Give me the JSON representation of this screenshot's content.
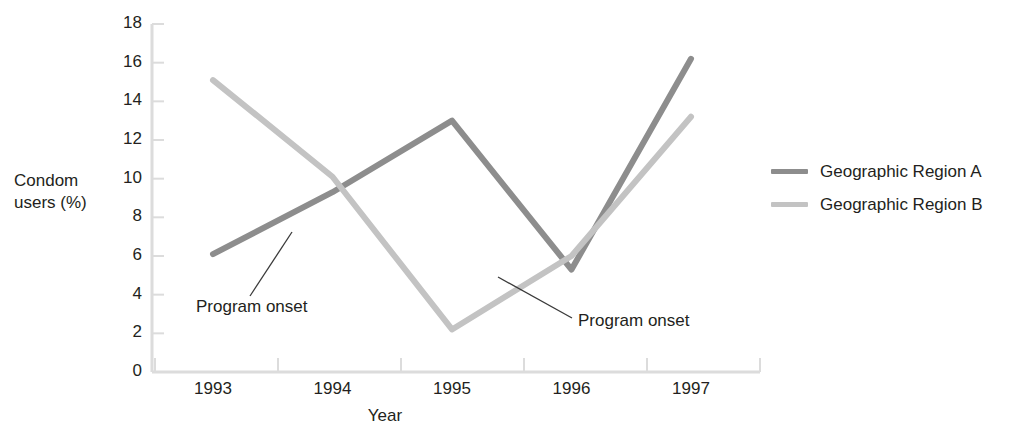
{
  "chart_data": {
    "type": "line",
    "title": "",
    "xlabel": "Year",
    "ylabel": "Condom users (%)",
    "categories": [
      "1993",
      "1994",
      "1995",
      "1996",
      "1997"
    ],
    "x": [
      1993,
      1994,
      1995,
      1996,
      1997
    ],
    "ylim": [
      0,
      18
    ],
    "yticks": [
      0,
      2,
      4,
      6,
      8,
      10,
      12,
      14,
      16,
      18
    ],
    "grid": false,
    "legend_position": "right",
    "series": [
      {
        "name": "Geographic Region A",
        "color": "#8d8d8d",
        "values": [
          6.1,
          9.3,
          13.0,
          5.3,
          16.2
        ]
      },
      {
        "name": "Geographic Region B",
        "color": "#c3c3c3",
        "values": [
          15.1,
          10.1,
          2.2,
          6.0,
          13.2
        ]
      }
    ],
    "annotations": [
      {
        "text": "Program onset",
        "target_series": "Geographic Region A",
        "target_x": 1993.45,
        "target_y": 7.6
      },
      {
        "text": "Program onset",
        "target_series": "Geographic Region B",
        "target_x": 1995.6,
        "target_y": 4.5
      }
    ]
  },
  "axes": {
    "y_title": "Condom\nusers (%)",
    "x_title": "Year",
    "y_tick_labels": [
      "18",
      "16",
      "14",
      "12",
      "10",
      "8",
      "6",
      "4",
      "2",
      "0"
    ],
    "x_tick_labels": [
      "1993",
      "1994",
      "1995",
      "1996",
      "1997"
    ],
    "axis_color": "#dcdcdc"
  },
  "legend": {
    "items": [
      {
        "label": "Geographic Region A",
        "color": "#8d8d8d"
      },
      {
        "label": "Geographic Region B",
        "color": "#c3c3c3"
      }
    ]
  },
  "annotations": {
    "a_label": "Program onset",
    "b_label": "Program onset"
  }
}
